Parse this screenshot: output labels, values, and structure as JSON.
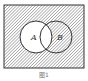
{
  "diagram": {
    "type": "venn",
    "universal_set": {
      "x": 4,
      "y": 5,
      "width": 80,
      "height": 63
    },
    "sets": [
      {
        "label": "A",
        "cx": 36,
        "cy": 37,
        "r": 16,
        "fill": "#ffffff"
      },
      {
        "label": "B",
        "cx": 56,
        "cy": 37,
        "r": 16,
        "fill": "hatched"
      }
    ],
    "shaded_region": "complement of A",
    "hatch_color": "#555555",
    "stroke_color": "#333333"
  },
  "caption": "图1"
}
